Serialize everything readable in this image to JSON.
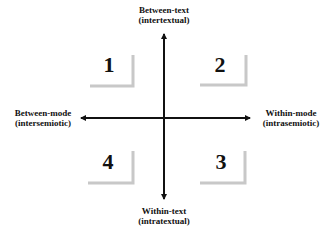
{
  "diagram": {
    "type": "quadrant-axes",
    "axes": {
      "top": {
        "line1": "Between-text",
        "line2": "(intertextual)"
      },
      "bottom": {
        "line1": "Within-text",
        "line2": "(intratextual)"
      },
      "left": {
        "line1": "Between-mode",
        "line2": "(intersemiotic)"
      },
      "right": {
        "line1": "Within-mode",
        "line2": "(intrasemiotic)"
      }
    },
    "quadrants": [
      {
        "position": "top-left",
        "label": "1"
      },
      {
        "position": "top-right",
        "label": "2"
      },
      {
        "position": "bottom-right",
        "label": "3"
      },
      {
        "position": "bottom-left",
        "label": "4"
      }
    ],
    "colors": {
      "axis": "#111111",
      "bracket": "#c8c8c8",
      "text": "#111111",
      "background": "#ffffff"
    }
  }
}
